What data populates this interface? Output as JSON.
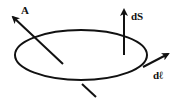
{
  "diagram": {
    "labels": {
      "vector_field": "A",
      "area_element": "dS",
      "line_element": "dℓ"
    },
    "colors": {
      "stroke": "#111111",
      "background": "#ffffff"
    }
  }
}
